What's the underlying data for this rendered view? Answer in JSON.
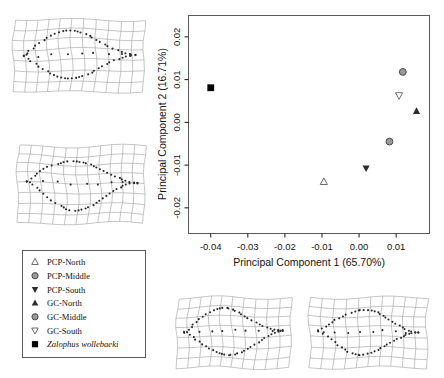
{
  "figure": {
    "type": "pca-scatter-with-deformation-grids",
    "background": "#ffffff"
  },
  "chart_data": {
    "type": "scatter",
    "title": "",
    "xlabel": "Principal Component 1 (65.70%)",
    "ylabel": "Principal Component 2 (16.71%)",
    "xlim": [
      -0.046,
      0.019
    ],
    "ylim": [
      -0.026,
      0.025
    ],
    "xticks": [
      "-0.04",
      "-0.03",
      "-0.02",
      "-0.01",
      "0.00",
      "0.01"
    ],
    "xtick_values": [
      -0.04,
      -0.03,
      -0.02,
      -0.01,
      0.0,
      0.01
    ],
    "yticks": [
      "-0.02",
      "-0.01",
      "0.00",
      "0.01",
      "0.02"
    ],
    "ytick_values": [
      -0.02,
      -0.01,
      0.0,
      0.01,
      0.02
    ],
    "grid": false,
    "legend_position": "outside-lower-left",
    "points": [
      {
        "label": "PCP-North",
        "x": -0.0095,
        "y": -0.0139,
        "marker": "triangle-up-open",
        "color": "#5e5e5e"
      },
      {
        "label": "PCP-Middle",
        "x": 0.0082,
        "y": -0.0045,
        "marker": "circle-grey",
        "color": "#6b6b6b"
      },
      {
        "label": "PCP-South",
        "x": 0.0019,
        "y": -0.0107,
        "marker": "triangle-down-solid",
        "color": "#2b2b2b"
      },
      {
        "label": "GC-North",
        "x": 0.0155,
        "y": 0.0026,
        "marker": "triangle-up-solid",
        "color": "#2b2b2b"
      },
      {
        "label": "GC-Middle",
        "x": 0.0118,
        "y": 0.0118,
        "marker": "circle-grey",
        "color": "#6b6b6b"
      },
      {
        "label": "GC-South",
        "x": 0.0108,
        "y": 0.0063,
        "marker": "triangle-down-open",
        "color": "#5e5e5e"
      },
      {
        "label": "Zalophus wollebaeki",
        "x": -0.04,
        "y": 0.0081,
        "marker": "square-solid",
        "color": "#000000"
      }
    ]
  },
  "legend": {
    "items": [
      {
        "label": "PCP-North",
        "marker": "triangle-up-open",
        "italic": false
      },
      {
        "label": "PCP-Middle",
        "marker": "circle-grey",
        "italic": false
      },
      {
        "label": "PCP-South",
        "marker": "triangle-down-solid",
        "italic": false
      },
      {
        "label": "GC-North",
        "marker": "triangle-up-solid",
        "italic": false
      },
      {
        "label": "GC-Middle",
        "marker": "circle-grey",
        "italic": false
      },
      {
        "label": "GC-South",
        "marker": "triangle-down-open",
        "italic": false
      },
      {
        "label": "Zalophus wollebaeki",
        "marker": "square-solid",
        "italic": true
      }
    ]
  },
  "deformation_grids": [
    {
      "name": "grid-top-left",
      "position": "top-left",
      "landmark_count": 62
    },
    {
      "name": "grid-middle-left",
      "position": "middle-left",
      "landmark_count": 62
    },
    {
      "name": "grid-bottom-center",
      "position": "bottom-center",
      "landmark_count": 62
    },
    {
      "name": "grid-bottom-right",
      "position": "bottom-right",
      "landmark_count": 62
    }
  ],
  "colors": {
    "axis": "#141414",
    "frame": "#5a5a5a",
    "grid_line": "#8c8c8c",
    "landmark": "#2a2a2a",
    "marker_grey": "#6b6b6b",
    "marker_dark": "#2b2b2b"
  }
}
